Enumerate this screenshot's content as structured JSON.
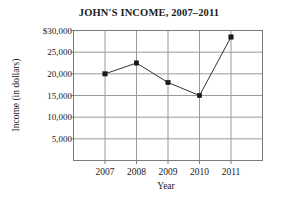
{
  "chart_data": {
    "type": "line",
    "title": "JOHN'S INCOME, 2007–2011",
    "xlabel": "Year",
    "ylabel": "Income (in dollars)",
    "categories": [
      "2007",
      "2008",
      "2009",
      "2010",
      "2011"
    ],
    "values": [
      20000,
      22500,
      18000,
      15000,
      28500
    ],
    "series": [
      {
        "name": "Income",
        "values": [
          20000,
          22500,
          18000,
          15000,
          28500
        ]
      }
    ],
    "x_tick_labels": [
      "2007",
      "2008",
      "2009",
      "2010",
      "2011"
    ],
    "y_tick_labels": [
      "5,000",
      "10,000",
      "15,000",
      "20,000",
      "25,000",
      "$30,000"
    ],
    "y_tick_values": [
      5000,
      10000,
      15000,
      20000,
      25000,
      30000
    ],
    "ylim": [
      0,
      30000
    ],
    "grid": true,
    "legend": "none",
    "marker": "square",
    "colors": {
      "line": "#333333",
      "marker": "#1a1a1a",
      "grid": "#9a9a9a",
      "axis": "#7a7a7a",
      "background": "#ffffff",
      "text": "#1a1a1a"
    }
  }
}
